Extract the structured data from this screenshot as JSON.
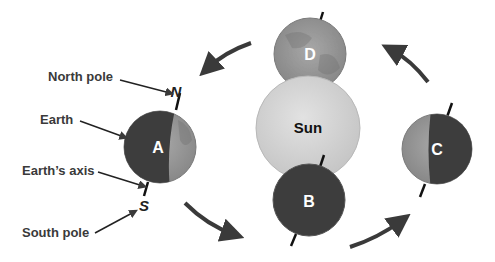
{
  "diagram": {
    "labels": {
      "north_pole": "North pole",
      "earth": "Earth",
      "earths_axis": "Earth’s axis",
      "south_pole": "South pole"
    },
    "pole_markers": {
      "north": "N",
      "south": "S"
    },
    "sun_label": "Sun",
    "positions": [
      {
        "id": "A",
        "label": "A",
        "location": "left"
      },
      {
        "id": "B",
        "label": "B",
        "location": "front"
      },
      {
        "id": "C",
        "label": "C",
        "location": "right"
      },
      {
        "id": "D",
        "label": "D",
        "location": "back"
      }
    ],
    "orbit_direction": "counterclockwise (as viewed)",
    "colors": {
      "night_side": "#3d3d3d",
      "day_side": "#9a9a9a",
      "sun": "#d4d4d4",
      "arrow": "#3a3a3a"
    }
  }
}
